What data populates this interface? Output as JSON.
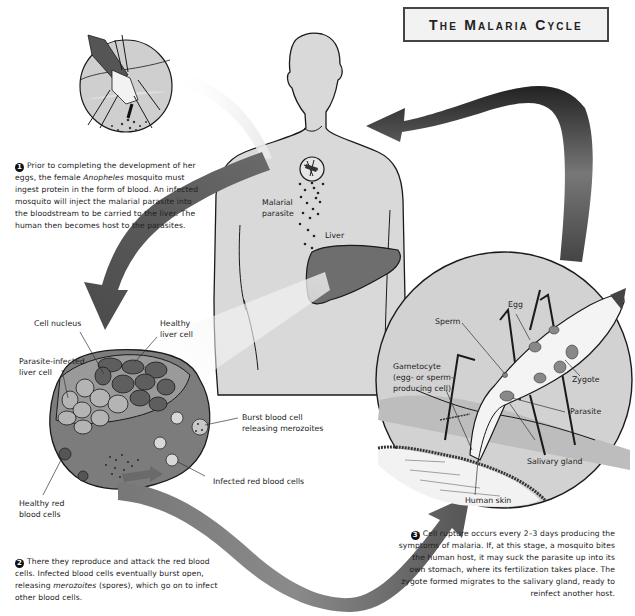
{
  "title": "The Malaria Cycle",
  "steps": [
    {
      "number": "1",
      "text_before": "Prior to completing the development of her eggs, the female ",
      "italic": "Anopheles",
      "text_after": " mosquito must ingest protein in the form of blood. An infected mosquito will inject the malarial parasite into the bloodstream to be carried to the liver. The human then becomes host to the parasites."
    },
    {
      "number": "2",
      "text_before": "There they reproduce and attack the red blood cells. Infected blood cells eventually burst open, releasing ",
      "italic": "merozoites",
      "text_after": " (spores), which go on to infect other blood cells."
    },
    {
      "number": "3",
      "text_before": "Cell rupture occurs every 2–3 days producing the symptoms of malaria. If, at this stage, a mosquito bites the human host, it may suck the parasite up into its own stomach, where its fertilization takes place. The zygote formed migrates to the salivary gland, ready to reinfect another host.",
      "italic": "",
      "text_after": ""
    }
  ],
  "labels": {
    "human": {
      "malarial_parasite_1": "Malarial",
      "malarial_parasite_2": "parasite",
      "liver": "Liver"
    },
    "liver_detail": {
      "cell_nucleus": "Cell nucleus",
      "healthy_liver_cell_1": "Healthy",
      "healthy_liver_cell_2": "liver cell",
      "parasite_infected_1": "Parasite-infected",
      "parasite_infected_2": "liver cell",
      "burst_blood_cell_1": "Burst blood cell",
      "burst_blood_cell_2": "releasing merozoites",
      "infected_red_blood_cells": "Infected red blood cells",
      "healthy_red_1": "Healthy red",
      "healthy_red_2": "blood cells"
    },
    "mosquito_detail": {
      "egg": "Egg",
      "sperm": "Sperm",
      "gametocyte_1": "Gametocyte",
      "gametocyte_2": "(egg- or sperm-",
      "gametocyte_3": "producing cell)",
      "zygote": "Zygote",
      "parasite": "Parasite",
      "salivary_gland": "Salivary gland",
      "human_skin": "Human skin"
    }
  },
  "colors": {
    "body_fill": "#d9d9d9",
    "liver_fill": "#6e6e6e",
    "arrow_dark": "#555555",
    "outline": "#1a1a1a"
  }
}
